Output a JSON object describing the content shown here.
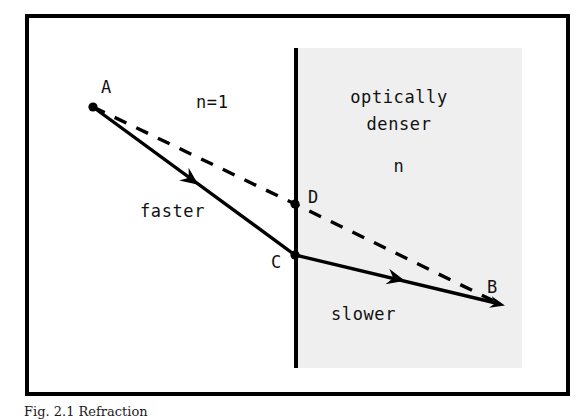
{
  "figure": {
    "domain": "diagram",
    "caption": "Fig. 2.1  Refraction",
    "frame": {
      "border_color": "#000000",
      "background_color": "#ffffff",
      "x": 25,
      "y": 14,
      "width": 545,
      "height": 382,
      "border_width": 4
    },
    "media": {
      "left": {
        "name": "n=1",
        "label": "n=1",
        "label_x": 196,
        "label_y": 108,
        "fill": "#ffffff",
        "speed_label": "faster",
        "speed_label_x": 140,
        "speed_label_y": 217
      },
      "right": {
        "name": "optically denser",
        "label_line1": "optically",
        "label_line2": "denser",
        "label_line3": "n",
        "label1_x": 399,
        "label1_y": 103,
        "label2_x": 399,
        "label2_y": 130,
        "label3_x": 399,
        "label3_y": 172,
        "fill": "#efefef",
        "speed_label": "slower",
        "speed_label_x": 331,
        "speed_label_y": 320,
        "region": {
          "x": 296,
          "y": 48,
          "width": 226,
          "height": 320
        }
      }
    },
    "boundary": {
      "name": "interface-line",
      "x": 296,
      "y_top": 48,
      "y_bottom": 368,
      "color": "#000000",
      "width": 4
    },
    "points": [
      {
        "id": "A",
        "label": "A",
        "x": 93,
        "y": 107,
        "label_x": 101,
        "label_y": 93,
        "dot": true
      },
      {
        "id": "D",
        "label": "D",
        "x": 295,
        "y": 204,
        "label_x": 308,
        "label_y": 203,
        "dot": true
      },
      {
        "id": "C",
        "label": "C",
        "x": 295,
        "y": 255,
        "label_x": 271,
        "label_y": 268,
        "dot": true
      },
      {
        "id": "B",
        "label": "B",
        "x": 500,
        "y": 304,
        "label_x": 487,
        "label_y": 293,
        "dot": true
      }
    ],
    "paths": {
      "actual_ray": {
        "name": "actual-refracted-ray",
        "style": "solid",
        "color": "#000000",
        "width": 3,
        "points": [
          [
            93,
            107
          ],
          [
            295,
            255
          ],
          [
            500,
            304
          ]
        ],
        "arrows": [
          {
            "x": 196,
            "y": 183,
            "angle": 36
          },
          {
            "x": 400,
            "y": 280,
            "angle": 13
          }
        ]
      },
      "straight_ray": {
        "name": "hypothetical-straight-ray",
        "style": "dashed",
        "color": "#000000",
        "width": 3,
        "dash": "12 11",
        "points": [
          [
            93,
            107
          ],
          [
            295,
            204
          ],
          [
            500,
            304
          ]
        ]
      }
    }
  }
}
